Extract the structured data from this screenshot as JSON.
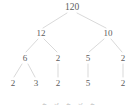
{
  "figure": {
    "kind": "factor-tree",
    "width": 137,
    "height": 111,
    "background_color": "#ffffff",
    "edge_color": "#c9c9c9",
    "label_color": "#5d5d5d",
    "caption_color": "#c8c8c8"
  },
  "chart_data": {
    "type": "diagram",
    "subtype": "factor-tree",
    "title": "",
    "xlabel": "",
    "ylabel": "",
    "grid": false,
    "legend": null,
    "root_value": 120,
    "levels": [
      {
        "level": 0,
        "values": [
          120
        ]
      },
      {
        "level": 1,
        "values": [
          12,
          10
        ]
      },
      {
        "level": 2,
        "values": [
          6,
          2,
          5,
          2
        ]
      },
      {
        "level": 3,
        "values": [
          2,
          3,
          2,
          5,
          2
        ]
      }
    ],
    "nodes": [
      {
        "id": "n0",
        "label": "120",
        "value": 120,
        "x": 72,
        "y": 7,
        "level": 0
      },
      {
        "id": "n1",
        "label": "12",
        "value": 12,
        "x": 41,
        "y": 33,
        "level": 1
      },
      {
        "id": "n2",
        "label": "10",
        "value": 10,
        "x": 108,
        "y": 33,
        "level": 1
      },
      {
        "id": "n1a",
        "label": "6",
        "value": 6,
        "x": 25,
        "y": 58,
        "level": 2
      },
      {
        "id": "n1b",
        "label": "2",
        "value": 2,
        "x": 58,
        "y": 58,
        "level": 2
      },
      {
        "id": "n2a",
        "label": "5",
        "value": 5,
        "x": 88,
        "y": 58,
        "level": 2
      },
      {
        "id": "n2b",
        "label": "2",
        "value": 2,
        "x": 123,
        "y": 58,
        "level": 2
      },
      {
        "id": "n1a1",
        "label": "2",
        "value": 2,
        "x": 13,
        "y": 83,
        "level": 3
      },
      {
        "id": "n1a2",
        "label": "3",
        "value": 3,
        "x": 36,
        "y": 83,
        "level": 3
      },
      {
        "id": "n1b1",
        "label": "2",
        "value": 2,
        "x": 58,
        "y": 83,
        "level": 3
      },
      {
        "id": "n2a1",
        "label": "5",
        "value": 5,
        "x": 88,
        "y": 83,
        "level": 3
      },
      {
        "id": "n2b1",
        "label": "2",
        "value": 2,
        "x": 123,
        "y": 83,
        "level": 3
      }
    ],
    "edges": [
      {
        "from": "n0",
        "to": "n1",
        "x1": 67,
        "y1": 13,
        "x2": 43,
        "y2": 28
      },
      {
        "from": "n0",
        "to": "n2",
        "x1": 77,
        "y1": 13,
        "x2": 106,
        "y2": 28
      },
      {
        "from": "n1",
        "to": "n1a",
        "x1": 38,
        "y1": 39,
        "x2": 26,
        "y2": 52
      },
      {
        "from": "n1",
        "to": "n1b",
        "x1": 44,
        "y1": 39,
        "x2": 57,
        "y2": 52
      },
      {
        "from": "n2",
        "to": "n2a",
        "x1": 104,
        "y1": 39,
        "x2": 89,
        "y2": 52
      },
      {
        "from": "n2",
        "to": "n2b",
        "x1": 111,
        "y1": 39,
        "x2": 122,
        "y2": 52
      },
      {
        "from": "n1a",
        "to": "n1a1",
        "x1": 22,
        "y1": 64,
        "x2": 14,
        "y2": 77
      },
      {
        "from": "n1a",
        "to": "n1a2",
        "x1": 28,
        "y1": 64,
        "x2": 35,
        "y2": 77
      },
      {
        "from": "n1b",
        "to": "n1b1",
        "x1": 58,
        "y1": 64,
        "x2": 58,
        "y2": 77
      },
      {
        "from": "n2a",
        "to": "n2a1",
        "x1": 88,
        "y1": 64,
        "x2": 88,
        "y2": 77
      },
      {
        "from": "n2b",
        "to": "n2b1",
        "x1": 123,
        "y1": 64,
        "x2": 123,
        "y2": 77
      }
    ],
    "caption": "2 · 3 · 2 · 5 · 2"
  }
}
